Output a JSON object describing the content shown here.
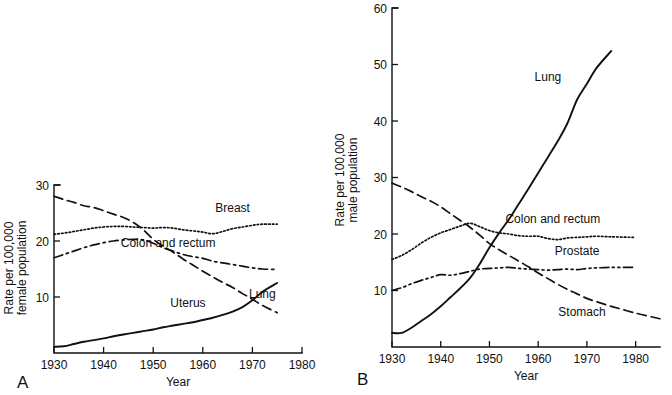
{
  "figure": {
    "background": "#ffffff",
    "ink_color": "#111111",
    "panel_a_label": "A",
    "panel_b_label": "B"
  },
  "chart_data": [
    {
      "id": "panel_a",
      "type": "line",
      "panel": "A",
      "title": "",
      "xlabel": "Year",
      "ylabel": "Rate per 100,000 female population",
      "ylabel_lines": [
        "Rate per 100,000",
        "female population"
      ],
      "xlim": [
        1930,
        1980
      ],
      "ylim": [
        0,
        30
      ],
      "xticks": [
        1930,
        1940,
        1950,
        1960,
        1970,
        1980
      ],
      "xtick_labels": [
        "1930",
        "1940",
        "1950",
        "1960",
        "1970",
        "1980"
      ],
      "yticks": [
        10,
        20,
        30
      ],
      "ytick_labels": [
        "10",
        "20",
        "30"
      ],
      "grid": false,
      "legend_position": "inline-annotations",
      "x": [
        1930,
        1932,
        1934,
        1936,
        1938,
        1940,
        1942,
        1944,
        1946,
        1948,
        1950,
        1952,
        1954,
        1956,
        1958,
        1960,
        1962,
        1964,
        1966,
        1968,
        1970,
        1972,
        1975
      ],
      "series": [
        {
          "name": "Uterus",
          "style": "long-dash",
          "label_x": 1957,
          "label_y": 8.2,
          "values": [
            28.0,
            27.4,
            26.9,
            26.3,
            26.0,
            25.4,
            24.8,
            24.2,
            23.3,
            22.0,
            20.3,
            19.1,
            18.0,
            16.8,
            15.7,
            14.6,
            13.6,
            12.6,
            11.7,
            10.6,
            9.6,
            8.5,
            7.2
          ]
        },
        {
          "name": "Breast",
          "style": "dotted",
          "label_x": 1966,
          "label_y": 25.2,
          "values": [
            21.2,
            21.4,
            21.7,
            22.0,
            22.3,
            22.5,
            22.6,
            22.6,
            22.5,
            22.4,
            22.3,
            22.4,
            22.3,
            22.0,
            21.8,
            21.6,
            21.3,
            21.7,
            22.2,
            22.5,
            22.8,
            23.0,
            23.0
          ]
        },
        {
          "name": "Colon and rectum",
          "style": "dash-dot",
          "label_x": 1953,
          "label_y": 19.0,
          "values": [
            17.0,
            17.6,
            18.2,
            18.8,
            19.3,
            19.7,
            20.0,
            20.2,
            20.3,
            20.2,
            19.6,
            18.8,
            18.2,
            17.6,
            17.2,
            16.9,
            16.4,
            16.1,
            15.8,
            15.5,
            15.2,
            15.0,
            14.9
          ]
        },
        {
          "name": "Lung",
          "style": "solid",
          "label_x": 1972,
          "label_y": 9.9,
          "values": [
            1.1,
            1.2,
            1.6,
            2.0,
            2.3,
            2.6,
            3.0,
            3.3,
            3.6,
            3.9,
            4.2,
            4.6,
            4.9,
            5.2,
            5.5,
            5.9,
            6.3,
            6.8,
            7.4,
            8.2,
            9.4,
            10.9,
            12.5
          ]
        }
      ]
    },
    {
      "id": "panel_b",
      "type": "line",
      "panel": "B",
      "title": "",
      "xlabel": "Year",
      "ylabel": "Rate per 100,000 male population",
      "ylabel_lines": [
        "Rate per 100,000",
        "male population"
      ],
      "xlim": [
        1930,
        1985
      ],
      "ylim": [
        0,
        60
      ],
      "xticks": [
        1930,
        1940,
        1950,
        1960,
        1970,
        1980
      ],
      "xtick_labels": [
        "1930",
        "1940",
        "1950",
        "1960",
        "1970",
        "1980"
      ],
      "yticks": [
        10,
        20,
        30,
        40,
        50,
        60
      ],
      "ytick_labels": [
        "10",
        "20",
        "30",
        "40",
        "50",
        "60"
      ],
      "grid": false,
      "legend_position": "inline-annotations",
      "x": [
        1930,
        1932,
        1934,
        1936,
        1938,
        1940,
        1942,
        1944,
        1946,
        1948,
        1950,
        1952,
        1954,
        1956,
        1958,
        1960,
        1962,
        1964,
        1966,
        1968,
        1970,
        1972,
        1975,
        1980,
        1985
      ],
      "series": [
        {
          "name": "Lung",
          "style": "solid",
          "label_x": 1962,
          "label_y": 47.0,
          "values": [
            2.5,
            2.5,
            3.4,
            4.6,
            5.8,
            7.2,
            8.8,
            10.4,
            12.2,
            14.7,
            17.6,
            20.2,
            22.6,
            25.3,
            28.0,
            30.8,
            33.6,
            36.4,
            39.6,
            43.8,
            46.6,
            49.4,
            52.4,
            null,
            null
          ]
        },
        {
          "name": "Stomach",
          "style": "long-dash",
          "label_x": 1969,
          "label_y": 5.4,
          "values": [
            29.0,
            28.3,
            27.5,
            26.6,
            25.8,
            24.8,
            23.6,
            22.4,
            21.2,
            19.8,
            18.3,
            17.2,
            16.2,
            15.2,
            14.2,
            13.1,
            12.1,
            11.1,
            10.2,
            9.4,
            8.6,
            8.0,
            7.2,
            6.0,
            5.0
          ]
        },
        {
          "name": "Colon and rectum",
          "style": "dotted",
          "label_x": 1963,
          "label_y": 22.0,
          "values": [
            15.5,
            16.2,
            17.2,
            18.4,
            19.4,
            20.2,
            20.8,
            21.4,
            21.9,
            21.3,
            20.6,
            20.2,
            20.0,
            19.7,
            19.6,
            19.6,
            19.2,
            19.0,
            19.3,
            19.4,
            19.5,
            19.6,
            19.5,
            19.4,
            null
          ]
        },
        {
          "name": "Prostate",
          "style": "dash-dot-dot",
          "label_x": 1968,
          "label_y": 16.2,
          "values": [
            10.0,
            10.5,
            11.2,
            11.8,
            12.3,
            12.8,
            12.7,
            13.0,
            13.4,
            13.8,
            13.9,
            14.0,
            14.1,
            13.9,
            13.8,
            13.7,
            13.6,
            13.7,
            13.8,
            13.7,
            13.9,
            14.0,
            14.1,
            14.1,
            null
          ]
        }
      ]
    }
  ]
}
